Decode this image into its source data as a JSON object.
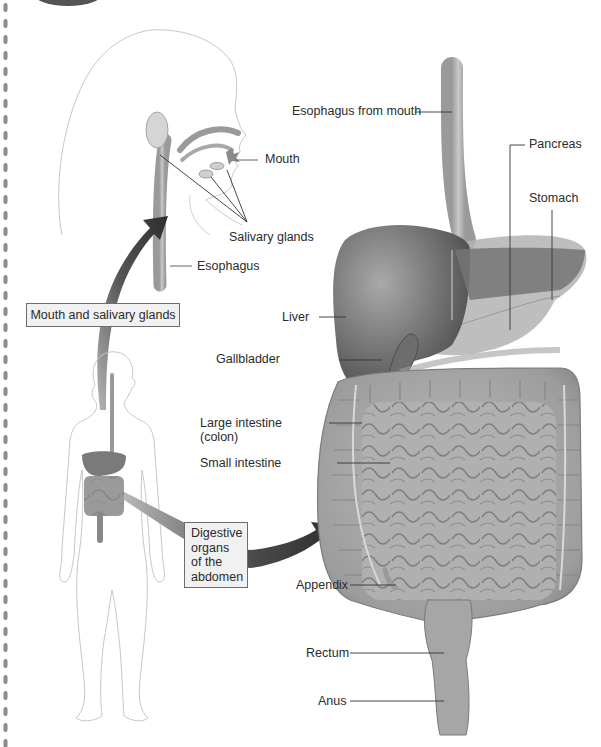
{
  "diagram": {
    "type": "anatomical-illustration",
    "callout_boxes": {
      "mouth_and_salivary": "Mouth and salivary glands",
      "abdomen": "Digestive\norgans\nof the\nabdomen"
    },
    "labels": {
      "mouth": "Mouth",
      "salivary_glands": "Salivary glands",
      "esophagus": "Esophagus",
      "esophagus_from_mouth": "Esophagus from mouth",
      "pancreas": "Pancreas",
      "stomach": "Stomach",
      "liver": "Liver",
      "gallbladder": "Gallbladder",
      "large_intestine": "Large intestine",
      "large_intestine_alt": "(colon)",
      "small_intestine": "Small intestine",
      "appendix": "Appendix",
      "rectum": "Rectum",
      "anus": "Anus"
    },
    "colors": {
      "organ_dark": "#5e5e5e",
      "organ_mid": "#8e8e8e",
      "organ_light": "#bdbdbd",
      "outline": "#c8c8c8",
      "arrow": "#3c3c3c",
      "box_fill": "#f1f1f1",
      "leader_line": "#333333"
    }
  }
}
